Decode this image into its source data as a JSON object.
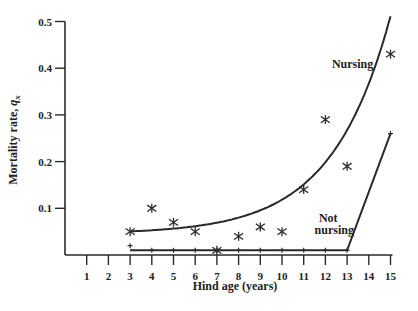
{
  "chart_data": {
    "type": "scatter",
    "title": "",
    "xlabel": "Hind age (years)",
    "ylabel": "Mortality rate, q_x",
    "ylabel_main": "Mortality rate, ",
    "ylabel_symbol": "q",
    "ylabel_sub": "x",
    "xlim": [
      0,
      15
    ],
    "ylim": [
      0,
      0.5
    ],
    "grid": false,
    "x_ticks": [
      1,
      2,
      3,
      4,
      5,
      6,
      7,
      8,
      9,
      10,
      11,
      12,
      13,
      14,
      15
    ],
    "x_tick_labels": [
      "1",
      "2",
      "3",
      "4",
      "5",
      "6",
      "7",
      "8",
      "9",
      "10",
      "11",
      "12",
      "13",
      "14",
      "15"
    ],
    "y_ticks": [
      0.1,
      0.2,
      0.3,
      0.4,
      0.5
    ],
    "y_tick_labels": [
      "0.1",
      "0.2",
      "0.3",
      "0.4",
      "0.5"
    ],
    "series": [
      {
        "name": "Nursing",
        "marker": "asterisk",
        "x": [
          3,
          4,
          5,
          6,
          7,
          8,
          9,
          10,
          11,
          12,
          13,
          15
        ],
        "y": [
          0.05,
          0.1,
          0.07,
          0.05,
          0.01,
          0.04,
          0.06,
          0.05,
          0.14,
          0.29,
          0.19,
          0.43
        ],
        "fit": {
          "type": "exponential curve",
          "x": [
            3,
            5,
            7,
            9,
            11,
            12,
            13,
            14,
            15
          ],
          "y": [
            0.05,
            0.055,
            0.07,
            0.095,
            0.14,
            0.175,
            0.23,
            0.31,
            0.46
          ]
        }
      },
      {
        "name": "Not nursing",
        "marker": "plus",
        "x": [
          3,
          4,
          5,
          6,
          7,
          8,
          9,
          10,
          11,
          12,
          13,
          15
        ],
        "y": [
          0.02,
          0.01,
          0.01,
          0.01,
          0.01,
          0.01,
          0.01,
          0.01,
          0.01,
          0.01,
          0.01,
          0.26
        ],
        "fit": {
          "type": "piecewise linear",
          "x": [
            3,
            13,
            15
          ],
          "y": [
            0.01,
            0.01,
            0.26
          ]
        }
      }
    ],
    "annotations": [
      {
        "text": "Nursing",
        "x": 12.3,
        "y": 0.4
      },
      {
        "text": "Not",
        "x": 11.7,
        "y": 0.07
      },
      {
        "text": "nursing",
        "x": 11.5,
        "y": 0.045
      }
    ],
    "legend": "inline annotations"
  }
}
